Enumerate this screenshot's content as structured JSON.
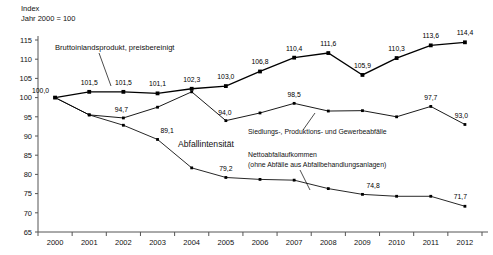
{
  "axis_header": {
    "line1": "Index",
    "line2": "Jahr 2000 = 100"
  },
  "annotations": {
    "gdp": "Bruttoinlandsprodukt, preisbereinigt",
    "intensity": "Abfallintensität",
    "waste_total": "Siedlungs-, Produktions- und Gewerbeabfälle",
    "net_waste_l1": "Nettoabfallaufkommen",
    "net_waste_l2": "(ohne Abfälle aus Abfallbehandlungsanlagen)"
  },
  "chart_data": {
    "type": "line",
    "title": "",
    "xlabel": "",
    "ylabel": "Index (Jahr 2000 = 100)",
    "ylim": [
      65,
      115
    ],
    "ytick_step": 5,
    "yticks": [
      "115",
      "110",
      "105",
      "100",
      "95",
      "90",
      "85",
      "80",
      "75",
      "70",
      "65"
    ],
    "grid": false,
    "legend_position": "inline-annotations",
    "categories": [
      "2000",
      "2001",
      "2002",
      "2003",
      "2004",
      "2005",
      "2006",
      "2007",
      "2008",
      "2009",
      "2010",
      "2011",
      "2012"
    ],
    "series": [
      {
        "name": "Bruttoinlandsprodukt, preisbereinigt",
        "values": [
          100.0,
          101.5,
          101.5,
          101.1,
          102.3,
          103.0,
          106.8,
          110.4,
          111.6,
          105.9,
          110.3,
          113.6,
          114.4
        ],
        "labels": [
          "100,0",
          "101,5",
          "101,5",
          "101,1",
          "102,3",
          "103,0",
          "106,8",
          "110,4",
          "111,6",
          "105,9",
          "110,3",
          "113,6",
          "114,4"
        ],
        "labeled": [
          true,
          true,
          true,
          true,
          true,
          true,
          true,
          true,
          true,
          true,
          true,
          true,
          true
        ]
      },
      {
        "name": "Siedlungs-, Produktions- und Gewerbeabfälle",
        "values": [
          100.0,
          95.5,
          94.7,
          97.5,
          101.5,
          94.0,
          96.0,
          98.5,
          96.5,
          96.6,
          95.0,
          97.7,
          93.0
        ],
        "labels": [
          "100,0",
          "",
          "94,7",
          "",
          "",
          "94,0",
          "",
          "98,5",
          "",
          "",
          "",
          "97,7",
          "93,0"
        ],
        "labeled": [
          false,
          false,
          true,
          false,
          false,
          true,
          false,
          true,
          false,
          false,
          false,
          true,
          true
        ]
      },
      {
        "name": "Nettoabfallaufkommen (ohne Abfälle aus Abfallbehandlungsanlagen)",
        "values": [
          100.0,
          95.5,
          92.8,
          89.1,
          81.7,
          79.2,
          78.7,
          78.5,
          76.3,
          74.8,
          74.3,
          74.3,
          71.7
        ],
        "labels": [
          "",
          "",
          "",
          "89,1",
          "",
          "79,2",
          "",
          "",
          "",
          "74,8",
          "",
          "",
          "71,7"
        ],
        "labeled": [
          false,
          false,
          false,
          true,
          false,
          true,
          false,
          false,
          false,
          true,
          false,
          false,
          true
        ]
      }
    ]
  }
}
